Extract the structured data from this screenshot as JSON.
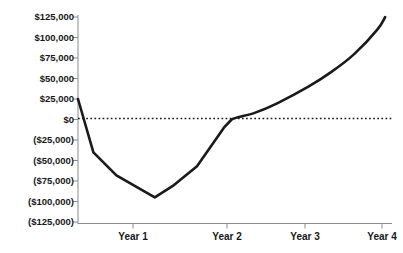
{
  "chart_data": {
    "type": "line",
    "title": "",
    "xlabel": "",
    "ylabel": "",
    "ylim": [
      -125000,
      125000
    ],
    "xlim": [
      0,
      4.05
    ],
    "grid": false,
    "legend": null,
    "zero_reference_line": {
      "value": 0,
      "style": "dotted",
      "color": "#1a1a1a"
    },
    "y_ticks": [
      125000,
      100000,
      75000,
      50000,
      25000,
      0,
      -25000,
      -50000,
      -75000,
      -100000,
      -125000
    ],
    "y_ticklabels": [
      "$125,000",
      "$100,000",
      "$75,000",
      "$50,000",
      "$25,000",
      "$0",
      "($25,000)",
      "($50,000)",
      "($75,000)",
      "($100,000)",
      "($125,000)"
    ],
    "x_ticks": [
      1,
      2,
      3,
      4
    ],
    "categories": [
      "Year 1",
      "Year 2",
      "Year 3",
      "Year 4"
    ],
    "x_ticklabels": [
      "Year 1",
      "Year 2",
      "Year 3",
      "Year 4"
    ],
    "series": [
      {
        "name": "Cumulative Cash Flow",
        "color": "#1a1a1a",
        "linewidth": 2.6,
        "x": [
          0.0,
          0.2,
          0.5,
          1.0,
          1.25,
          1.55,
          1.9,
          2.0,
          2.3,
          2.6,
          3.0,
          3.3,
          3.6,
          3.9,
          4.0
        ],
        "values": [
          25000,
          -40000,
          -68000,
          -95000,
          -80000,
          -57000,
          -10000,
          0,
          8000,
          20000,
          40000,
          58000,
          80000,
          110000,
          125000
        ]
      }
    ]
  },
  "axis": {
    "y_axis_line_color": "#8c8c94",
    "x_axis_line_color": "#8c8c94",
    "tick_color": "#8c8c94"
  }
}
